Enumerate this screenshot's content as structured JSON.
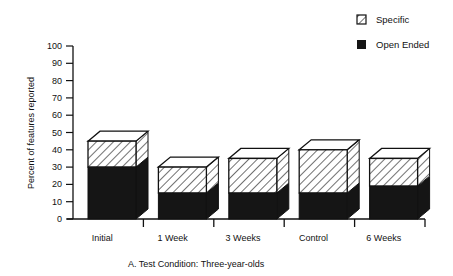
{
  "chart_data": {
    "type": "bar",
    "stacked": true,
    "style": "3d",
    "title": "",
    "caption": "A.  Test Condition:  Three-year-olds",
    "xlabel": "",
    "ylabel": "Percent of features reported",
    "ylim": [
      0,
      100
    ],
    "yticks": [
      0,
      10,
      20,
      30,
      40,
      50,
      60,
      70,
      80,
      90,
      100
    ],
    "categories": [
      "Initial",
      "1 Week",
      "3 Weeks",
      "Control",
      "6 Weeks"
    ],
    "series": [
      {
        "name": "Open Ended",
        "pattern": "solid-black",
        "values": [
          30,
          15,
          15,
          15,
          19
        ]
      },
      {
        "name": "Specific",
        "pattern": "hatched",
        "values": [
          15,
          15,
          20,
          25,
          16
        ]
      }
    ],
    "totals": [
      45,
      30,
      35,
      40,
      35
    ],
    "legend": {
      "position": "top-right",
      "entries": [
        "Specific",
        "Open Ended"
      ]
    },
    "grid": false
  },
  "colors": {
    "open_ended": "#151515",
    "specific_fill": "#ffffff",
    "hatch": "#111111",
    "axis": "#111111"
  }
}
